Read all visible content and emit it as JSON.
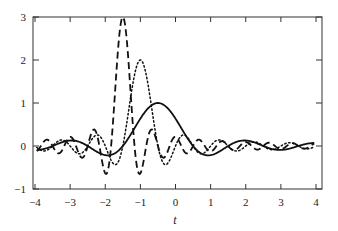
{
  "chart_data": {
    "type": "line",
    "title": "",
    "xlabel": "t",
    "ylabel": "",
    "xlim": [
      -4,
      4
    ],
    "ylim": [
      -1,
      3
    ],
    "xticks": [
      "-4",
      "-3",
      "-2",
      "-1",
      "0",
      "1",
      "2",
      "3",
      "4"
    ],
    "yticks": [
      "-1",
      "0",
      "1",
      "2",
      "3"
    ],
    "grid": false,
    "legend": null,
    "series": [
      {
        "name": "solid",
        "style": "solid",
        "amplitude": 1,
        "center": -0.5,
        "scale": 1,
        "peak": [
          -0.5,
          1.0
        ]
      },
      {
        "name": "dotted",
        "style": "dotted",
        "amplitude": 2,
        "center": -1.0,
        "scale": 2,
        "peak": [
          -1.0,
          2.0
        ]
      },
      {
        "name": "dashed",
        "style": "dashed",
        "amplitude": 3,
        "center": -1.5,
        "scale": 3,
        "peak": [
          -1.5,
          3.0
        ]
      }
    ]
  },
  "axes": {
    "xlabel": "t"
  }
}
